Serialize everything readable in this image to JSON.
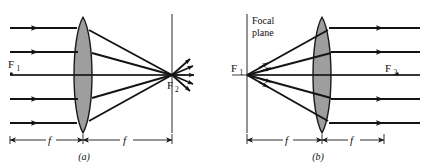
{
  "figure": {
    "background_color": "#ffffff",
    "ink_color": "#101010",
    "lens_fill_color": "#9e9e9e",
    "lens_stroke_color": "#1a1a1a",
    "ray_color": "#141414",
    "axis_color": "#2a2a2a",
    "dimension_color": "#1a1a1a"
  },
  "panels": [
    {
      "id": "a",
      "caption": "(a)",
      "description": "Parallel rays entering a converging lens from the left converge to the second focal point F2 on the right, then diverge beyond it.",
      "labels": {
        "focal_point_left": "F",
        "focal_point_left_sub": "1",
        "focal_point_right": "F",
        "focal_point_right_sub": "2",
        "focal_plane": ""
      },
      "dimensions": [
        {
          "label": "f",
          "side": "left",
          "meaning": "focal length from left focal point to lens"
        },
        {
          "label": "f",
          "side": "right",
          "meaning": "focal length from lens to right focal point"
        }
      ],
      "ray_count": 5,
      "incoming_rays": "parallel to axis",
      "outgoing_rays": "converging to F2 then diverging"
    },
    {
      "id": "b",
      "caption": "(b)",
      "description": "Rays diverging from the first focal point F1 located on the focal plane emerge from the converging lens parallel to the axis.",
      "labels": {
        "focal_point_left": "F",
        "focal_point_left_sub": "1",
        "focal_point_right": "F",
        "focal_point_right_sub": "2",
        "focal_plane_line1": "Focal",
        "focal_plane_line2": "plane"
      },
      "dimensions": [
        {
          "label": "f",
          "side": "left",
          "meaning": "focal length from focal plane to lens"
        },
        {
          "label": "f",
          "side": "right",
          "meaning": "focal length from lens to second focal point"
        }
      ],
      "ray_count": 5,
      "incoming_rays": "diverging from F1",
      "outgoing_rays": "parallel to axis"
    }
  ]
}
